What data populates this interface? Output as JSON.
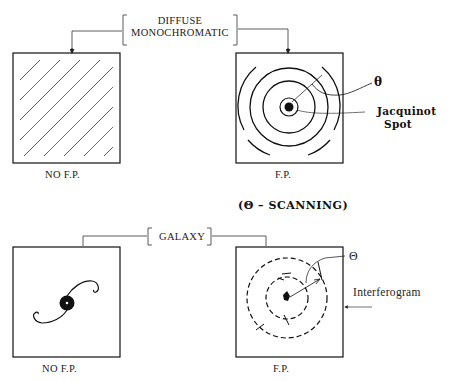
{
  "top": {
    "source_label_line1": "DIFFUSE",
    "source_label_line2": "MONOCHROMATIC",
    "left_caption": "NO F.P.",
    "right_caption": "F.P.",
    "theta_label": "θ",
    "jacquinot_line1": "Jacquinot",
    "jacquinot_line2": "Spot"
  },
  "scanning_note": "(Θ – SCANNING)",
  "bottom": {
    "source_label": "GALAXY",
    "left_caption": "NO F.P.",
    "right_caption": "F.P.",
    "theta_label": "Θ",
    "interferogram_label": "Interferogram"
  },
  "colors": {
    "ink": "#111111",
    "background": "#ffffff"
  }
}
